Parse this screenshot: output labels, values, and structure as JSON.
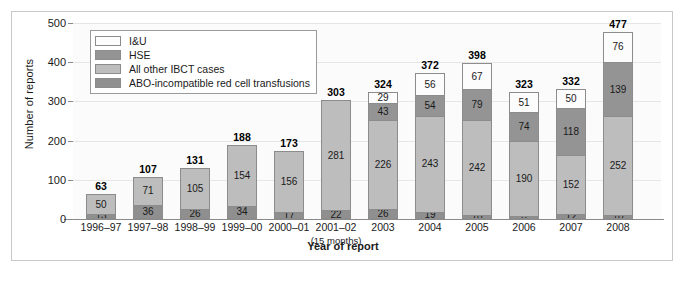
{
  "chart_data": {
    "type": "bar",
    "subtype": "stacked-vertical",
    "title": "",
    "xlabel": "Year of report",
    "ylabel": "Number of reports",
    "ylim": [
      0,
      500
    ],
    "yticks": [
      0,
      100,
      200,
      300,
      400,
      500
    ],
    "grid": true,
    "legend_position": "top-left-inside",
    "categories": [
      "1996–97",
      "1997–98",
      "1998–99",
      "1999–00",
      "2000–01",
      "2001–02",
      "2003",
      "2004",
      "2005",
      "2006",
      "2007",
      "2008"
    ],
    "category_sublabels": [
      "",
      "",
      "",
      "",
      "",
      "(15 months)",
      "",
      "",
      "",
      "",
      "",
      ""
    ],
    "series": [
      {
        "name": "ABO-incompatible red cell transfusions",
        "color": "#8f8f8f",
        "values": [
          13,
          36,
          26,
          34,
          17,
          22,
          26,
          19,
          10,
          8,
          12,
          10
        ]
      },
      {
        "name": "All other IBCT cases",
        "color": "#bdbdbd",
        "values": [
          50,
          71,
          105,
          154,
          156,
          281,
          226,
          243,
          242,
          190,
          152,
          252
        ]
      },
      {
        "name": "HSE",
        "color": "#949494",
        "values": [
          null,
          null,
          null,
          null,
          null,
          null,
          43,
          54,
          79,
          74,
          118,
          139
        ]
      },
      {
        "name": "I&U",
        "color": "#fcfcfc",
        "values": [
          null,
          null,
          null,
          null,
          null,
          null,
          29,
          56,
          67,
          51,
          50,
          76
        ]
      }
    ],
    "totals": [
      63,
      107,
      131,
      188,
      173,
      303,
      324,
      372,
      398,
      323,
      332,
      477
    ]
  },
  "legend": {
    "items": [
      {
        "label": "I&U",
        "color": "#fcfcfc"
      },
      {
        "label": "HSE",
        "color": "#949494"
      },
      {
        "label": "All other IBCT cases",
        "color": "#bdbdbd"
      },
      {
        "label": "ABO-incompatible red cell transfusions",
        "color": "#8f8f8f"
      }
    ]
  }
}
